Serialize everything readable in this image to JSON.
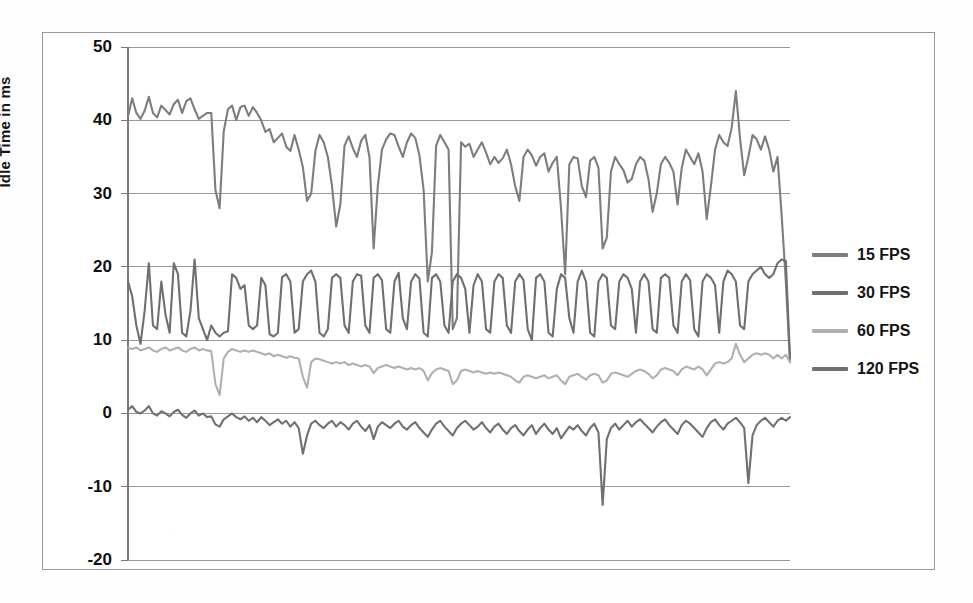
{
  "chart_data": {
    "type": "line",
    "title": "",
    "xlabel": "",
    "ylabel": "Idle Time in ms",
    "ylim": [
      -20,
      50
    ],
    "yticks": [
      50,
      40,
      30,
      20,
      10,
      0,
      -10,
      -20
    ],
    "ytick_labels": [
      "50",
      "40",
      "30",
      "20",
      "10",
      "0",
      "-10",
      "-20"
    ],
    "grid": true,
    "grid_axis": "y",
    "legend_position": "right",
    "x_axis_visible_ticks": false,
    "n_points": 160,
    "series": [
      {
        "name": "15 FPS",
        "color": "#7d7d7d",
        "values": [
          40.5,
          43.0,
          41.0,
          40.2,
          41.3,
          43.2,
          41.0,
          40.4,
          42.0,
          41.4,
          40.8,
          42.2,
          42.8,
          41.0,
          42.6,
          43.0,
          41.5,
          40.2,
          40.6,
          41.0,
          41.0,
          30.5,
          28.0,
          38.5,
          41.5,
          42.0,
          40.0,
          41.8,
          42.0,
          40.6,
          41.8,
          41.0,
          40.0,
          38.4,
          38.8,
          37.0,
          37.6,
          38.2,
          36.4,
          35.8,
          38.0,
          36.0,
          33.6,
          29.0,
          30.0,
          35.8,
          38.0,
          37.0,
          35.0,
          31.0,
          25.5,
          28.5,
          36.5,
          37.8,
          36.2,
          35.0,
          37.2,
          38.0,
          35.0,
          22.5,
          31.0,
          36.0,
          37.4,
          38.2,
          38.0,
          36.4,
          35.0,
          37.0,
          38.2,
          37.6,
          35.2,
          30.5,
          18.0,
          22.0,
          36.5,
          38.0,
          37.0,
          36.0,
          11.5,
          13.0,
          37.0,
          36.4,
          36.8,
          35.0,
          36.0,
          37.0,
          35.6,
          34.0,
          35.0,
          34.2,
          34.8,
          36.0,
          34.0,
          31.0,
          29.0,
          35.0,
          36.0,
          35.2,
          33.8,
          35.0,
          35.5,
          33.0,
          34.2,
          35.0,
          28.0,
          19.0,
          34.0,
          35.0,
          34.8,
          31.0,
          29.5,
          34.5,
          35.0,
          33.5,
          22.5,
          24.0,
          33.0,
          35.0,
          34.0,
          33.2,
          31.5,
          32.0,
          34.0,
          35.0,
          34.5,
          32.0,
          27.5,
          30.0,
          34.0,
          35.0,
          34.2,
          33.0,
          28.5,
          33.5,
          36.0,
          35.0,
          34.0,
          35.5,
          33.0,
          26.5,
          31.0,
          36.0,
          38.0,
          37.0,
          36.5,
          39.0,
          44.0,
          37.5,
          32.5,
          35.0,
          38.0,
          37.4,
          36.0,
          37.8,
          36.0,
          33.0,
          35.0,
          27.0,
          18.0,
          7.0
        ]
      },
      {
        "name": "30 FPS",
        "color": "#6f6f6f",
        "values": [
          18.0,
          16.0,
          12.0,
          9.5,
          14.0,
          20.5,
          12.0,
          11.5,
          18.0,
          13.5,
          11.0,
          20.5,
          19.0,
          11.0,
          10.5,
          14.0,
          21.0,
          13.0,
          11.5,
          10.0,
          12.0,
          11.0,
          10.5,
          11.0,
          11.2,
          19.0,
          18.5,
          17.0,
          17.5,
          12.0,
          11.5,
          12.0,
          18.5,
          17.5,
          10.8,
          10.5,
          11.0,
          18.6,
          19.0,
          18.0,
          11.0,
          11.5,
          18.0,
          19.0,
          19.5,
          18.0,
          11.0,
          10.5,
          11.5,
          18.5,
          19.0,
          18.5,
          12.0,
          11.0,
          18.0,
          19.0,
          18.8,
          12.0,
          11.0,
          18.5,
          19.0,
          18.2,
          11.5,
          11.0,
          18.0,
          19.2,
          13.0,
          11.5,
          18.0,
          19.0,
          18.4,
          11.0,
          10.5,
          18.5,
          19.0,
          18.0,
          12.0,
          11.0,
          18.0,
          19.0,
          18.5,
          17.0,
          11.0,
          17.5,
          19.0,
          18.0,
          11.5,
          11.0,
          18.0,
          19.0,
          18.5,
          12.0,
          11.0,
          18.0,
          19.0,
          18.2,
          11.5,
          10.0,
          18.5,
          19.0,
          18.0,
          11.0,
          10.5,
          17.0,
          19.0,
          18.5,
          13.0,
          11.0,
          18.0,
          19.5,
          18.0,
          11.0,
          10.5,
          18.0,
          19.0,
          18.5,
          12.0,
          11.5,
          18.0,
          19.0,
          18.5,
          17.0,
          11.0,
          18.0,
          19.0,
          18.0,
          11.5,
          11.0,
          18.5,
          19.0,
          18.5,
          12.0,
          11.0,
          18.0,
          19.0,
          18.2,
          11.5,
          10.5,
          18.0,
          19.0,
          18.5,
          17.5,
          11.0,
          18.0,
          19.5,
          19.0,
          18.0,
          12.0,
          11.5,
          18.0,
          19.0,
          19.5,
          20.0,
          19.0,
          18.5,
          19.0,
          20.5,
          21.0,
          20.8,
          7.5
        ]
      },
      {
        "name": "60 FPS",
        "color": "#b0b0b0",
        "values": [
          9.0,
          8.8,
          9.0,
          8.6,
          8.8,
          9.0,
          8.6,
          8.4,
          8.8,
          9.0,
          8.6,
          8.8,
          9.0,
          8.6,
          8.4,
          8.8,
          9.0,
          8.6,
          8.8,
          8.6,
          8.5,
          4.0,
          2.5,
          7.5,
          8.4,
          8.8,
          8.6,
          8.4,
          8.6,
          8.4,
          8.6,
          8.4,
          8.2,
          8.0,
          8.2,
          7.8,
          8.0,
          7.8,
          7.6,
          7.8,
          7.6,
          7.5,
          5.0,
          3.5,
          7.0,
          7.5,
          7.4,
          7.2,
          7.0,
          6.8,
          7.0,
          6.8,
          7.0,
          6.6,
          6.8,
          6.6,
          6.4,
          6.6,
          6.4,
          5.5,
          6.2,
          6.4,
          6.6,
          6.4,
          6.2,
          6.4,
          6.2,
          6.0,
          6.2,
          6.0,
          6.2,
          5.8,
          4.5,
          5.5,
          6.0,
          6.2,
          6.0,
          5.8,
          4.0,
          4.5,
          5.8,
          6.0,
          5.8,
          5.6,
          5.8,
          5.6,
          5.4,
          5.6,
          5.4,
          5.6,
          5.4,
          5.2,
          5.0,
          4.5,
          4.2,
          5.0,
          5.2,
          5.0,
          4.8,
          5.0,
          5.2,
          4.8,
          5.0,
          5.2,
          4.5,
          4.0,
          5.0,
          5.2,
          5.4,
          5.0,
          4.6,
          5.2,
          5.4,
          5.2,
          4.2,
          4.5,
          5.4,
          5.6,
          5.4,
          5.2,
          5.0,
          5.4,
          5.8,
          6.0,
          5.8,
          5.4,
          4.8,
          5.2,
          6.0,
          6.2,
          6.0,
          5.8,
          5.2,
          6.0,
          6.4,
          6.2,
          6.0,
          6.4,
          6.0,
          5.2,
          6.0,
          6.8,
          7.0,
          6.8,
          7.0,
          7.5,
          9.5,
          8.0,
          7.0,
          7.5,
          8.0,
          8.2,
          8.0,
          8.2,
          8.0,
          7.5,
          8.0,
          7.5,
          8.0,
          7.0
        ]
      },
      {
        "name": "120 FPS",
        "color": "#707070",
        "values": [
          0.5,
          1.0,
          0.2,
          0.0,
          0.4,
          1.0,
          0.0,
          -0.3,
          0.3,
          0.0,
          -0.4,
          0.2,
          0.5,
          -0.2,
          -0.6,
          0.0,
          0.4,
          -0.3,
          0.0,
          -0.5,
          -0.4,
          -1.5,
          -1.8,
          -0.8,
          -0.4,
          0.0,
          -0.5,
          -0.8,
          -0.4,
          -1.0,
          -0.6,
          -1.2,
          -0.5,
          -1.0,
          -1.6,
          -1.2,
          -0.8,
          -1.4,
          -1.0,
          -1.8,
          -1.2,
          -2.0,
          -5.5,
          -3.0,
          -1.4,
          -1.0,
          -1.6,
          -2.0,
          -1.4,
          -1.0,
          -1.8,
          -1.2,
          -1.6,
          -2.2,
          -1.4,
          -1.0,
          -1.8,
          -2.4,
          -1.6,
          -3.5,
          -1.8,
          -1.2,
          -1.6,
          -2.0,
          -1.4,
          -1.0,
          -1.8,
          -2.2,
          -1.6,
          -1.2,
          -2.0,
          -2.6,
          -3.2,
          -2.2,
          -1.4,
          -1.0,
          -1.8,
          -2.4,
          -3.0,
          -2.0,
          -1.4,
          -1.0,
          -1.6,
          -2.2,
          -1.8,
          -1.2,
          -2.0,
          -2.6,
          -1.8,
          -1.4,
          -2.2,
          -2.8,
          -2.0,
          -1.6,
          -2.4,
          -3.0,
          -2.2,
          -1.6,
          -2.8,
          -2.0,
          -1.4,
          -2.2,
          -2.8,
          -2.0,
          -3.4,
          -2.6,
          -1.8,
          -2.2,
          -1.6,
          -2.4,
          -3.0,
          -2.0,
          -1.4,
          -2.6,
          -12.5,
          -3.5,
          -2.0,
          -1.4,
          -2.2,
          -1.6,
          -1.0,
          -1.8,
          -1.2,
          -0.8,
          -1.4,
          -2.0,
          -2.6,
          -1.8,
          -1.2,
          -0.8,
          -1.6,
          -2.2,
          -2.8,
          -1.6,
          -1.0,
          -1.4,
          -2.0,
          -2.6,
          -3.2,
          -2.0,
          -1.2,
          -0.8,
          -1.6,
          -2.2,
          -1.4,
          -1.0,
          -0.6,
          -1.2,
          -2.0,
          -9.5,
          -3.0,
          -1.6,
          -1.0,
          -0.6,
          -1.2,
          -1.8,
          -1.0,
          -0.6,
          -1.0,
          -0.5
        ]
      }
    ]
  },
  "legend": {
    "items": [
      {
        "label": "15 FPS"
      },
      {
        "label": "30 FPS"
      },
      {
        "label": "60 FPS"
      },
      {
        "label": "120 FPS"
      }
    ]
  },
  "axis": {
    "y_title": "Idle Time in ms",
    "y_labels": [
      "50",
      "40",
      "30",
      "20",
      "10",
      "0",
      "-10",
      "-20"
    ]
  },
  "colors": {
    "series_15": "#7d7d7d",
    "series_30": "#6f6f6f",
    "series_60": "#b0b0b0",
    "series_120": "#707070",
    "grid": "#999999",
    "axis": "#7a7a7a",
    "frame": "#9a9a9a",
    "text": "#141414",
    "background": "#ffffff"
  }
}
